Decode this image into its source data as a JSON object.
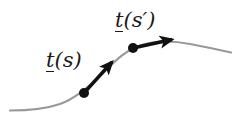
{
  "figure": {
    "type": "vector-field-on-curve-diagram",
    "background_color": "#ffffff",
    "width": 245,
    "height": 127,
    "curve": {
      "name": "trajectory-curve",
      "color": "#999999",
      "stroke_width": 2.2,
      "description": "smooth gray S-shaped curve rising from lower-left to upper-right then flattening"
    },
    "points": [
      {
        "name": "point-s",
        "label": "t(s)",
        "color": "#111111",
        "cx": 84,
        "cy": 93,
        "r": 5
      },
      {
        "name": "point-s-prime",
        "label": "t(s')",
        "color": "#111111",
        "cx": 133,
        "cy": 48,
        "r": 5
      }
    ],
    "arrows": [
      {
        "name": "tangent-vector-s",
        "color": "#111111",
        "x1": 84,
        "y1": 93,
        "x2": 113,
        "y2": 61,
        "stroke_width": 3.4
      },
      {
        "name": "tangent-vector-s-prime",
        "color": "#111111",
        "x1": 133,
        "y1": 48,
        "x2": 173,
        "y2": 39,
        "stroke_width": 3.4
      }
    ],
    "labels": {
      "t_of_s": {
        "symbol": "t",
        "open_paren": "(",
        "argument": "s",
        "close_paren": ")",
        "full_text": "t(s)"
      },
      "t_of_s_prime": {
        "symbol": "t",
        "open_paren": "(",
        "argument": "s",
        "prime": "′",
        "close_paren": ")",
        "full_text": "t(s′)"
      }
    }
  }
}
